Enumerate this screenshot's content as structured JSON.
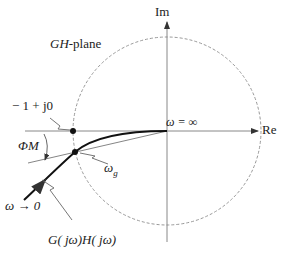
{
  "diagram": {
    "title": "GH-plane",
    "title_italic": "GH",
    "title_suffix": "-plane",
    "axes": {
      "real": "Re",
      "imag": "Im"
    },
    "labels": {
      "critical_point": "− 1 + j0",
      "omega_inf": "ω = ∞",
      "phase_margin": "ΦM",
      "omega_g": "ω",
      "omega_g_sub": "g",
      "omega_zero": "ω → 0",
      "curve": "G( jω)H( jω)"
    },
    "colors": {
      "curve": "#111111",
      "axis": "#888888",
      "circle": "#999999"
    }
  }
}
